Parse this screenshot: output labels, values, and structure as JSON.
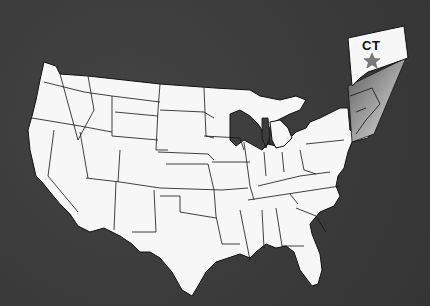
{
  "map": {
    "title": "United States (contiguous) locator map",
    "highlight_state": {
      "abbr": "CT",
      "name": "Connecticut",
      "marker": "star-icon",
      "marker_color": "#7a7a7a"
    },
    "colors": {
      "background": "#3c3c3c",
      "land": "#f7f7f7",
      "borders": "#111111",
      "callout_gradient_start": "#9a9a9a",
      "callout_gradient_end": "#e0e0e0"
    }
  }
}
